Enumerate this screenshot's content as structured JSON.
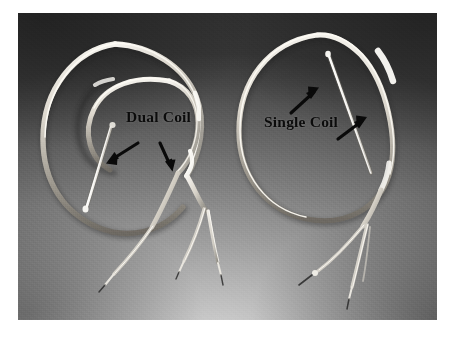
{
  "figure": {
    "kind": "photograph",
    "plate_background_color": "#8a8a8a",
    "page_background_color": "#ffffff",
    "ink_color": "#0b0b0b",
    "device_highlight_color": "#f2f0ea"
  },
  "labels": {
    "dual_coil": "Dual Coil",
    "single_coil": "Single Coil"
  },
  "annotations": {
    "arrows": [
      {
        "name": "arrow-dual-proximal-coil",
        "direction": "down-left",
        "target": "proximal coil of dual coil lead"
      },
      {
        "name": "arrow-dual-distal-coil",
        "direction": "down",
        "target": "distal coil of dual coil lead"
      },
      {
        "name": "arrow-single-coil-upper",
        "direction": "up-right",
        "target": "coil of single coil lead"
      },
      {
        "name": "arrow-single-coil-lower",
        "direction": "up-right",
        "target": "coil of single coil lead"
      }
    ]
  },
  "devices": [
    {
      "name": "dual-coil-lead",
      "label": "Dual Coil",
      "coil_count": 2,
      "side": "left",
      "connector_tails": 3
    },
    {
      "name": "single-coil-lead",
      "label": "Single Coil",
      "coil_count": 1,
      "side": "right",
      "connector_tails": 2
    }
  ]
}
